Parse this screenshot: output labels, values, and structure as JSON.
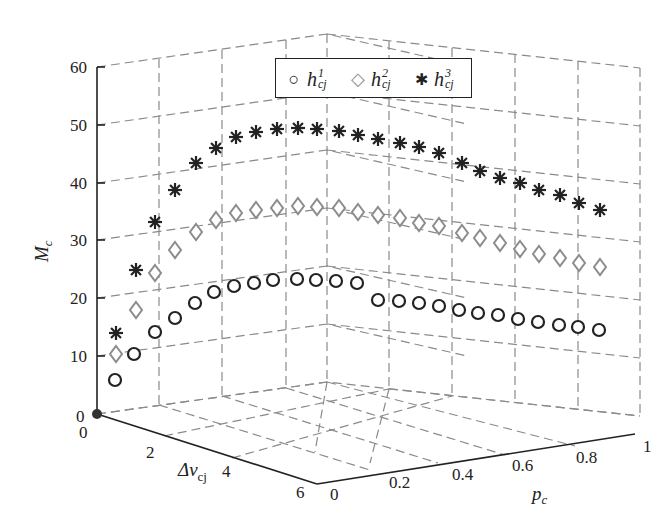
{
  "chart_data": {
    "type": "scatter",
    "subtype": "3d-scatter",
    "title": "",
    "xlabel": "p_c",
    "ylabel": "Δv_cj",
    "zlabel": "M_c",
    "x_ticks": [
      "0",
      "0.2",
      "0.4",
      "0.6",
      "0.8",
      "1"
    ],
    "y_ticks": [
      "0",
      "2",
      "4",
      "6"
    ],
    "z_ticks": [
      "0",
      "10",
      "20",
      "30",
      "40",
      "50",
      "60"
    ],
    "xlim": [
      0,
      1
    ],
    "ylim": [
      0,
      6
    ],
    "zlim": [
      0,
      60
    ],
    "grid": true,
    "legend_position": "top-center",
    "legend": [
      "h_cj^1",
      "h_cj^2",
      "h_cj^3"
    ],
    "series": [
      {
        "name": "h_cj^1",
        "marker": "circle",
        "color": "#222222",
        "values": [
          6,
          10.5,
          14,
          16.5,
          18.5,
          20,
          20.5,
          20.8,
          21,
          21,
          20.8,
          20.5,
          20.2,
          20,
          19.6,
          19.2,
          18.8,
          18.4,
          18,
          17.5,
          17,
          16.5,
          16,
          15.5,
          15
        ]
      },
      {
        "name": "h_cj^2",
        "marker": "diamond",
        "color": "#8c8c8c",
        "values": [
          10.5,
          18,
          24.5,
          28.5,
          31.5,
          33.5,
          35,
          35.5,
          36,
          36,
          35.8,
          35.5,
          35,
          34.5,
          34,
          33.3,
          32.5,
          32,
          31.3,
          30.5,
          29.8,
          29,
          28.3,
          27.5,
          26
        ]
      },
      {
        "name": "h_cj^3",
        "marker": "star",
        "color": "#222222",
        "values": [
          14.5,
          25.5,
          33.5,
          39,
          43.5,
          46,
          48,
          49,
          49.3,
          49.3,
          49.2,
          48.8,
          48.2,
          47.5,
          46.8,
          46,
          45.2,
          44.5,
          43.5,
          42.8,
          41.8,
          41,
          40,
          39,
          37.5
        ]
      }
    ],
    "origin_marker": "0"
  },
  "legend": {
    "items": [
      {
        "symbol": "○",
        "base": "h",
        "sup": "1",
        "sub": "cj"
      },
      {
        "symbol": "◇",
        "base": "h",
        "sup": "2",
        "sub": "cj"
      },
      {
        "symbol": "✱",
        "base": "h",
        "sup": "3",
        "sub": "cj"
      }
    ]
  },
  "axes": {
    "z_label": "M",
    "z_label_sub": "c",
    "y_label": "Δv",
    "y_label_sub": "cj",
    "x_label": "p",
    "x_label_sub": "c"
  },
  "screen": {
    "circle_pts": [
      [
        115,
        380
      ],
      [
        134,
        354
      ],
      [
        155,
        332
      ],
      [
        175,
        318
      ],
      [
        195,
        303
      ],
      [
        214,
        292
      ],
      [
        234,
        286
      ],
      [
        254,
        283
      ],
      [
        273,
        280
      ],
      [
        297,
        279
      ],
      [
        316,
        280
      ],
      [
        336,
        281
      ],
      [
        357,
        283
      ],
      [
        378,
        300
      ],
      [
        399,
        301
      ],
      [
        419,
        303
      ],
      [
        439,
        306
      ],
      [
        459,
        310
      ],
      [
        478,
        313
      ],
      [
        498,
        315
      ],
      [
        518,
        319
      ],
      [
        538,
        322
      ],
      [
        559,
        325
      ],
      [
        578,
        327
      ],
      [
        599,
        330
      ]
    ],
    "diamond_pts": [
      [
        116,
        354
      ],
      [
        136,
        310
      ],
      [
        155,
        273
      ],
      [
        175,
        250
      ],
      [
        196,
        232
      ],
      [
        216,
        220
      ],
      [
        236,
        213
      ],
      [
        256,
        210
      ],
      [
        277,
        208
      ],
      [
        298,
        206
      ],
      [
        317,
        207
      ],
      [
        339,
        208
      ],
      [
        358,
        212
      ],
      [
        378,
        215
      ],
      [
        400,
        218
      ],
      [
        419,
        223
      ],
      [
        439,
        226
      ],
      [
        462,
        233
      ],
      [
        480,
        238
      ],
      [
        500,
        243
      ],
      [
        520,
        249
      ],
      [
        539,
        254
      ],
      [
        560,
        258
      ],
      [
        579,
        263
      ],
      [
        600,
        267
      ]
    ],
    "star_pts": [
      [
        116,
        333
      ],
      [
        136,
        270
      ],
      [
        155,
        222
      ],
      [
        175,
        190
      ],
      [
        196,
        163
      ],
      [
        216,
        148
      ],
      [
        236,
        137
      ],
      [
        256,
        132
      ],
      [
        277,
        129
      ],
      [
        298,
        128
      ],
      [
        317,
        129
      ],
      [
        339,
        131
      ],
      [
        358,
        135
      ],
      [
        378,
        139
      ],
      [
        400,
        143
      ],
      [
        419,
        147
      ],
      [
        439,
        153
      ],
      [
        462,
        163
      ],
      [
        480,
        171
      ],
      [
        500,
        178
      ],
      [
        520,
        183
      ],
      [
        539,
        190
      ],
      [
        560,
        195
      ],
      [
        579,
        203
      ],
      [
        600,
        210
      ]
    ]
  }
}
